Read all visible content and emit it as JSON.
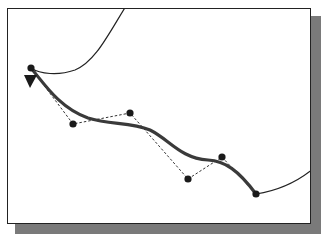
{
  "figure": {
    "colors": {
      "frame_border": "#222222",
      "shadow": "#7a7a7a",
      "background": "#ffffff",
      "main_curve": "#3a3a3a",
      "thin_curve": "#222222",
      "control_polygon": "#333333",
      "points": "#1a1a1a"
    },
    "control_points": [
      {
        "id": "p0",
        "x": 31,
        "y": 68
      },
      {
        "id": "p1",
        "x": 73,
        "y": 124
      },
      {
        "id": "p2",
        "x": 130,
        "y": 113
      },
      {
        "id": "p3",
        "x": 188,
        "y": 179
      },
      {
        "id": "p4",
        "x": 222,
        "y": 157
      },
      {
        "id": "p5",
        "x": 256,
        "y": 194
      }
    ],
    "start_marker": {
      "shape": "triangle-down",
      "x": 30,
      "y": 81
    },
    "icons": [
      "triangle-down-icon",
      "control-point-icon"
    ]
  }
}
